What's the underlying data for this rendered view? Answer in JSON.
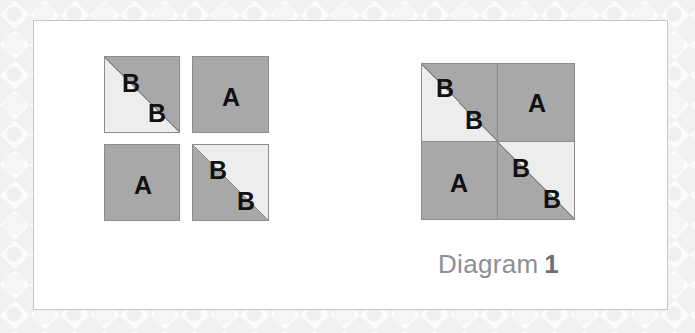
{
  "figure": {
    "caption_text": "Diagram",
    "caption_number": "1"
  },
  "colors": {
    "gray_fill": "#a8a8a8",
    "light_fill": "#ededed",
    "tile_border": "#8c8c8c",
    "panel_border": "#c4c5c9",
    "panel_background": "#ffffff",
    "page_background": "#fcfcfd",
    "label_color": "#111111",
    "caption_color": "#8d8f93",
    "caption_number_color": "#6f7175"
  },
  "separate_tiles": [
    {
      "id": "tile-1",
      "style": "diagonal",
      "diagonal": "bottom-left-to-top-right",
      "upper_left_fill": "gray",
      "lower_right_fill": "light",
      "upper_left_label": "B",
      "lower_right_label": "B"
    },
    {
      "id": "tile-2",
      "style": "solid",
      "fill": "gray",
      "label": "A"
    },
    {
      "id": "tile-3",
      "style": "solid",
      "fill": "gray",
      "label": "A"
    },
    {
      "id": "tile-4",
      "style": "diagonal",
      "diagonal": "bottom-left-to-top-right",
      "upper_left_fill": "light",
      "lower_right_fill": "gray",
      "upper_left_label": "B",
      "lower_right_label": "B"
    }
  ],
  "assembled_square": {
    "top_left": {
      "style": "diagonal",
      "upper_left_fill": "gray",
      "lower_right_fill": "light",
      "upper_left_label": "B",
      "lower_right_label": "B"
    },
    "top_right": {
      "style": "solid",
      "fill": "gray",
      "label": "A"
    },
    "bottom_left": {
      "style": "solid",
      "fill": "gray",
      "label": "A"
    },
    "bottom_right": {
      "style": "diagonal",
      "upper_left_fill": "light",
      "lower_right_fill": "gray",
      "upper_left_label": "B",
      "lower_right_label": "B"
    }
  }
}
